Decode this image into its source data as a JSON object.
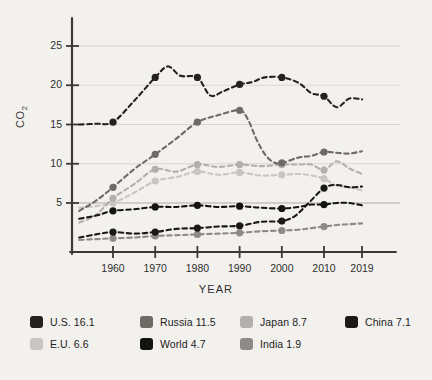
{
  "chart_data": {
    "type": "line",
    "title": "",
    "xlabel": "YEAR",
    "ylabel": "CO2",
    "ylabel_display": "CO₂",
    "xlim": [
      1952,
      2019
    ],
    "ylim": [
      0,
      27
    ],
    "y_ticks": [
      5,
      10,
      15,
      20,
      25
    ],
    "x_ticks": [
      1960,
      1970,
      1980,
      1990,
      2000,
      2010,
      2019
    ],
    "x_tick_labels": [
      "1960",
      "1970",
      "1980",
      "1990",
      "2000",
      "2010",
      "2019"
    ],
    "y_tick_labels": [
      "5",
      "10",
      "15",
      "20",
      "25"
    ],
    "grid": "horizontal",
    "legend_position": "bottom",
    "marker": "circle",
    "line_style": "dashed",
    "series": [
      {
        "name": "U.S.",
        "final_value": 16.1,
        "legend_label": "U.S. 16.1",
        "color": "#24211f",
        "x": [
          1952,
          1956,
          1960,
          1965,
          1970,
          1973,
          1976,
          1980,
          1983,
          1986,
          1990,
          1993,
          1996,
          2000,
          2004,
          2007,
          2010,
          2013,
          2016,
          2019
        ],
        "y": [
          15.0,
          15.1,
          15.3,
          18.0,
          21.0,
          22.4,
          21.2,
          21.0,
          18.7,
          19.2,
          20.1,
          20.4,
          21.0,
          21.0,
          20.3,
          19.0,
          18.6,
          17.2,
          18.3,
          18.2
        ],
        "markers_x": [
          1960,
          1970,
          1980,
          1990,
          2000,
          2010
        ],
        "markers_y": [
          15.3,
          21.0,
          21.0,
          20.1,
          21.0,
          18.6
        ]
      },
      {
        "name": "Russia",
        "final_value": 11.5,
        "legend_label": "Russia 11.5",
        "color": "#6e6a66",
        "x": [
          1952,
          1956,
          1960,
          1965,
          1970,
          1975,
          1980,
          1985,
          1990,
          1992,
          1994,
          1996,
          1998,
          2000,
          2004,
          2007,
          2010,
          2013,
          2016,
          2019
        ],
        "y": [
          4.0,
          5.3,
          7.0,
          9.3,
          11.2,
          13.2,
          15.3,
          16.2,
          16.8,
          15.6,
          13.1,
          11.2,
          10.2,
          10.1,
          10.8,
          11.0,
          11.5,
          11.4,
          11.3,
          11.6
        ],
        "markers_x": [
          1960,
          1970,
          1980,
          1990,
          2000,
          2010
        ],
        "markers_y": [
          7.0,
          11.2,
          15.3,
          16.8,
          10.1,
          11.5
        ]
      },
      {
        "name": "Japan",
        "final_value": 8.7,
        "legend_label": "Japan 8.7",
        "color": "#b3b0ac",
        "x": [
          1952,
          1956,
          1960,
          1965,
          1970,
          1975,
          1980,
          1985,
          1990,
          1995,
          2000,
          2004,
          2007,
          2010,
          2013,
          2016,
          2019
        ],
        "y": [
          2.5,
          3.5,
          5.6,
          7.4,
          9.3,
          9.0,
          9.9,
          9.6,
          9.9,
          9.7,
          9.9,
          9.9,
          9.9,
          9.2,
          10.3,
          9.4,
          8.7
        ],
        "markers_x": [
          1960,
          1970,
          1980,
          1990,
          2000,
          2010
        ],
        "markers_y": [
          5.6,
          9.3,
          9.9,
          9.9,
          9.9,
          9.2
        ]
      },
      {
        "name": "China",
        "final_value": 7.1,
        "legend_label": "China 7.1",
        "color": "#1b1917",
        "x": [
          1952,
          1956,
          1960,
          1965,
          1970,
          1975,
          1980,
          1985,
          1990,
          1995,
          2000,
          2003,
          2006,
          2010,
          2013,
          2016,
          2019
        ],
        "y": [
          0.6,
          1.0,
          1.3,
          1.1,
          1.3,
          1.7,
          1.8,
          2.0,
          2.1,
          2.6,
          2.7,
          3.3,
          4.8,
          6.9,
          7.3,
          7.0,
          7.1
        ],
        "markers_x": [
          1960,
          1970,
          1980,
          1990,
          2000,
          2010
        ],
        "markers_y": [
          1.3,
          1.3,
          1.8,
          2.1,
          2.7,
          6.9
        ]
      },
      {
        "name": "E.U.",
        "final_value": 6.6,
        "legend_label": "E.U. 6.6",
        "color": "#c9c6c2",
        "x": [
          1952,
          1956,
          1960,
          1965,
          1970,
          1975,
          1980,
          1985,
          1990,
          1995,
          2000,
          2004,
          2007,
          2010,
          2013,
          2016,
          2019
        ],
        "y": [
          4.4,
          4.6,
          5.0,
          6.3,
          7.8,
          8.3,
          9.0,
          8.6,
          8.9,
          8.5,
          8.6,
          8.7,
          8.5,
          8.1,
          7.2,
          7.0,
          6.6
        ],
        "markers_x": [
          1960,
          1970,
          1980,
          1990,
          2000,
          2010
        ],
        "markers_y": [
          5.0,
          7.8,
          9.0,
          8.9,
          8.6,
          8.1
        ]
      },
      {
        "name": "World",
        "final_value": 4.7,
        "legend_label": "World 4.7",
        "color": "#141312",
        "x": [
          1952,
          1956,
          1960,
          1965,
          1970,
          1975,
          1980,
          1985,
          1990,
          1995,
          2000,
          2004,
          2007,
          2010,
          2013,
          2016,
          2019
        ],
        "y": [
          3.0,
          3.4,
          4.0,
          4.2,
          4.5,
          4.5,
          4.7,
          4.5,
          4.6,
          4.4,
          4.3,
          4.5,
          4.8,
          4.8,
          5.0,
          5.0,
          4.7
        ],
        "markers_x": [
          1960,
          1970,
          1980,
          1990,
          2000,
          2010
        ],
        "markers_y": [
          4.0,
          4.5,
          4.7,
          4.6,
          4.3,
          4.8
        ]
      },
      {
        "name": "India",
        "final_value": 1.9,
        "legend_label": "India 1.9",
        "color": "#8e8a86",
        "x": [
          1952,
          1956,
          1960,
          1965,
          1970,
          1975,
          1980,
          1985,
          1990,
          1995,
          2000,
          2004,
          2007,
          2010,
          2013,
          2016,
          2019
        ],
        "y": [
          0.3,
          0.4,
          0.5,
          0.6,
          0.8,
          0.9,
          1.0,
          1.1,
          1.2,
          1.4,
          1.5,
          1.6,
          1.8,
          2.0,
          2.2,
          2.3,
          2.4
        ],
        "markers_x": [
          1960,
          1970,
          1980,
          1990,
          2000,
          2010
        ],
        "markers_y": [
          0.5,
          0.8,
          1.0,
          1.2,
          1.5,
          2.0
        ]
      }
    ]
  },
  "axes": {
    "y_title": "CO₂",
    "x_title": "YEAR"
  },
  "legend": {
    "rows": [
      [
        {
          "label": "U.S. 16.1",
          "color": "#24211f",
          "name": "us"
        },
        {
          "label": "Russia 11.5",
          "color": "#6e6a66",
          "name": "russia"
        },
        {
          "label": "Japan 8.7",
          "color": "#b3b0ac",
          "name": "japan"
        },
        {
          "label": "China 7.1",
          "color": "#1b1917",
          "name": "china"
        }
      ],
      [
        {
          "label": "E.U. 6.6",
          "color": "#c9c6c2",
          "name": "eu"
        },
        {
          "label": "World 4.7",
          "color": "#141312",
          "name": "world"
        },
        {
          "label": "India 1.9",
          "color": "#8e8a86",
          "name": "india"
        }
      ]
    ]
  }
}
